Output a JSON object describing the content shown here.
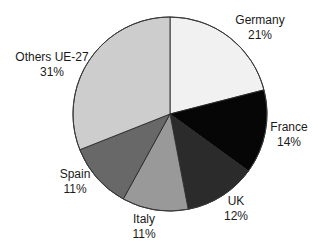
{
  "chart_data": {
    "type": "pie",
    "title": "",
    "start_angle_deg": 0,
    "direction": "clockwise",
    "categories": [
      "Germany",
      "France",
      "UK",
      "Italy",
      "Spain",
      "Others UE-27"
    ],
    "values": [
      21,
      14,
      12,
      11,
      11,
      31
    ],
    "labels": [
      "21%",
      "14%",
      "12%",
      "11%",
      "11%",
      "31%"
    ],
    "colors": [
      "#f1f1f1",
      "#060606",
      "#2b2b2b",
      "#999999",
      "#686868",
      "#cdcdcd"
    ],
    "legend": "none (labels placed outside slices)",
    "unit": "%"
  },
  "slices": [
    {
      "name": "Germany",
      "pct": "21%",
      "lx": 260,
      "ly": 24
    },
    {
      "name": "France",
      "pct": "14%",
      "lx": 289,
      "ly": 131
    },
    {
      "name": "UK",
      "pct": "12%",
      "lx": 236,
      "ly": 205
    },
    {
      "name": "Italy",
      "pct": "11%",
      "lx": 144,
      "ly": 223
    },
    {
      "name": "Spain",
      "pct": "11%",
      "lx": 75,
      "ly": 178
    },
    {
      "name": "Others UE-27",
      "pct": "31%",
      "lx": 52,
      "ly": 61
    }
  ]
}
